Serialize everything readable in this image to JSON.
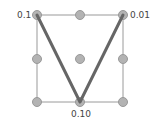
{
  "diagram": {
    "grid": {
      "xs": [
        37,
        80,
        123
      ],
      "ys": [
        15,
        59,
        102
      ],
      "line_color": "#9a9a9a",
      "node_color": "#b3b3b3",
      "node_stroke": "#999999"
    },
    "path": {
      "color": "#666666",
      "points": [
        [
          37,
          15
        ],
        [
          80,
          102
        ],
        [
          123,
          15
        ]
      ]
    },
    "labels": {
      "top_left": "0.1",
      "top_right": "0.01",
      "bottom_center": "0.10"
    }
  }
}
